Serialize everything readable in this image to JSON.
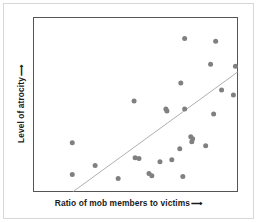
{
  "figure": {
    "background_color": "#ffffff",
    "outer_border_color": "#d8d8d8",
    "plot_border_color": "#555555"
  },
  "axes": {
    "x_title": "Ratio of mob members to victims",
    "y_title": "Level of atrocity",
    "arrow_glyph": "⟶",
    "x_arrow_name": "x-axis-arrow",
    "y_arrow_name": "y-axis-arrow"
  },
  "chart_data": {
    "type": "scatter",
    "title": "",
    "xlabel": "Ratio of mob members to victims",
    "ylabel": "Level of atrocity",
    "xlim": [
      0,
      100
    ],
    "ylim": [
      0,
      100
    ],
    "grid": false,
    "legend": null,
    "axis_ticks": "none",
    "marker": {
      "color": "#808080",
      "shape": "circle",
      "size_px": 5
    },
    "trendline": {
      "present": true,
      "color": "#b0b0b0",
      "width_px": 1,
      "x_start": 19.5,
      "y_start": 0,
      "x_end": 100,
      "y_end": 68.6,
      "description": "upward sloping least-squares style line"
    },
    "points": [
      {
        "x": 74.1,
        "y": 88.0
      },
      {
        "x": 89.3,
        "y": 86.3
      },
      {
        "x": 86.8,
        "y": 73.1
      },
      {
        "x": 99.0,
        "y": 72.0
      },
      {
        "x": 72.2,
        "y": 62.3
      },
      {
        "x": 92.2,
        "y": 58.3
      },
      {
        "x": 49.3,
        "y": 52.0
      },
      {
        "x": 64.9,
        "y": 47.4
      },
      {
        "x": 74.1,
        "y": 47.4
      },
      {
        "x": 88.3,
        "y": 44.6
      },
      {
        "x": 77.1,
        "y": 31.4
      },
      {
        "x": 77.6,
        "y": 28.6
      },
      {
        "x": 19.0,
        "y": 28.0
      },
      {
        "x": 84.4,
        "y": 26.3
      },
      {
        "x": 71.7,
        "y": 24.6
      },
      {
        "x": 49.8,
        "y": 19.4
      },
      {
        "x": 51.7,
        "y": 18.9
      },
      {
        "x": 67.8,
        "y": 18.3
      },
      {
        "x": 62.0,
        "y": 17.1
      },
      {
        "x": 30.2,
        "y": 14.9
      },
      {
        "x": 56.6,
        "y": 10.3
      },
      {
        "x": 19.0,
        "y": 9.7
      },
      {
        "x": 73.2,
        "y": 8.6
      },
      {
        "x": 41.5,
        "y": 7.4
      },
      {
        "x": 98.0,
        "y": 55.4
      },
      {
        "x": 65.4,
        "y": 46.3
      },
      {
        "x": 78.0,
        "y": 30.3
      },
      {
        "x": 58.0,
        "y": 9.1
      }
    ]
  }
}
